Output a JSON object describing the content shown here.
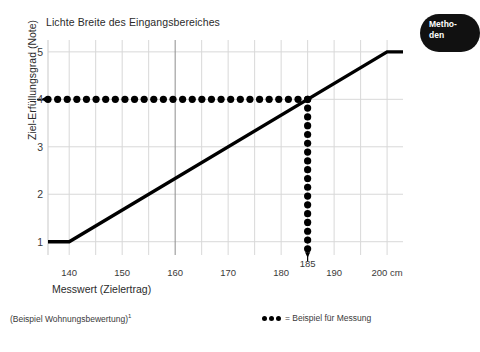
{
  "chart_data": {
    "type": "line",
    "title": "Lichte Breite des Eingangsbereiches",
    "xlabel": "Messwert (Zielertrag)",
    "ylabel": "Ziel-Erfüllungsgrad (Note)",
    "xlim": [
      136,
      203
    ],
    "ylim": [
      0.72,
      5.25
    ],
    "grid": true,
    "x_ticks": [
      {
        "value": 140,
        "label": "140",
        "raised": false
      },
      {
        "value": 150,
        "label": "150",
        "raised": false
      },
      {
        "value": 160,
        "label": "160",
        "raised": false
      },
      {
        "value": 170,
        "label": "170",
        "raised": false
      },
      {
        "value": 180,
        "label": "180",
        "raised": false
      },
      {
        "value": 185,
        "label": "185",
        "raised": true
      },
      {
        "value": 190,
        "label": "190",
        "raised": false
      },
      {
        "value": 200,
        "label": "200 cm",
        "raised": false
      }
    ],
    "y_ticks": [
      {
        "value": 1,
        "label": "1"
      },
      {
        "value": 2,
        "label": "2"
      },
      {
        "value": 3,
        "label": "3"
      },
      {
        "value": 4,
        "label": "4"
      },
      {
        "value": 5,
        "label": "5"
      }
    ],
    "x_gridlines": [
      140,
      145,
      150,
      155,
      160,
      165,
      170,
      175,
      180,
      185,
      190,
      195,
      200
    ],
    "x_gridlines_major": [
      160
    ],
    "y_gridlines": [
      1,
      2,
      3,
      4,
      5
    ],
    "series": [
      {
        "name": "Bewertungsfunktion",
        "type": "line",
        "color": "#000000",
        "width": 3.4,
        "points": [
          {
            "x": 136,
            "y": 1
          },
          {
            "x": 140,
            "y": 1
          },
          {
            "x": 200,
            "y": 5
          },
          {
            "x": 203,
            "y": 5
          }
        ]
      },
      {
        "name": "Beispiel für Messung (horizontal)",
        "type": "dotted-guide",
        "color": "#000000",
        "orientation": "horizontal",
        "y": 4,
        "x_from": 136,
        "x_to": 185,
        "dot_count": 28,
        "dot_radius": 3.6,
        "arrow_at": "start"
      },
      {
        "name": "Beispiel für Messung (vertikal)",
        "type": "dotted-guide",
        "color": "#000000",
        "orientation": "vertical",
        "x": 185,
        "y_from": 4,
        "y_to": 0.85,
        "dot_count": 18,
        "dot_radius": 3.6,
        "arrow_at": "end"
      }
    ],
    "annotations": [
      {
        "text": "Messwert 185 cm ergibt Note 4",
        "x": 185,
        "y": 4
      }
    ]
  },
  "footnote": {
    "text": "(Beispiel Wohnungsbewertung)",
    "marker": "1"
  },
  "legend": {
    "symbol_dots": 3,
    "text": "= Beispiel für Messung"
  },
  "callout": {
    "line1": "Metho-",
    "line2": "den"
  }
}
